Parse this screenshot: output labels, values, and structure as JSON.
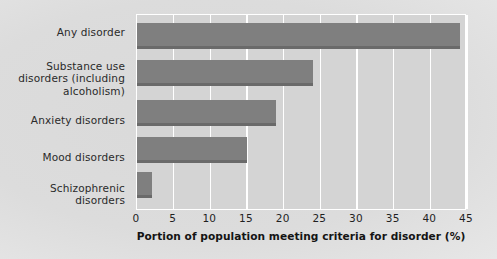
{
  "chart_data": {
    "type": "bar",
    "orientation": "horizontal",
    "title": "",
    "xlabel": "Portion of population meeting criteria for disorder (%)",
    "ylabel": "",
    "categories": [
      "Any disorder",
      "Substance use disorders (including alcoholism)",
      "Anxiety disorders",
      "Mood disorders",
      "Schizophrenic disorders"
    ],
    "category_lines": [
      [
        "Any disorder"
      ],
      [
        "Substance use",
        "disorders (including",
        "alcoholism)"
      ],
      [
        "Anxiety disorders"
      ],
      [
        "Mood disorders"
      ],
      [
        "Schizophrenic",
        "disorders"
      ]
    ],
    "values": [
      44,
      24,
      19,
      15,
      2
    ],
    "xlim": [
      0,
      45
    ],
    "xticks": [
      0,
      5,
      10,
      15,
      20,
      25,
      30,
      35,
      40,
      45
    ],
    "xtick_labels": [
      "0",
      "5",
      "10",
      "15",
      "20",
      "25",
      "30",
      "35",
      "40",
      "45"
    ],
    "grid": "vertical-white",
    "legend": "none",
    "colors": {
      "bar": "#7f7f7f",
      "bar_shadow": "#6a6a6a",
      "plot_background": "#d4d4d4",
      "gridline": "#ffffff",
      "figure_background": "#dcdcdc",
      "text": "#1f1f1f"
    }
  }
}
